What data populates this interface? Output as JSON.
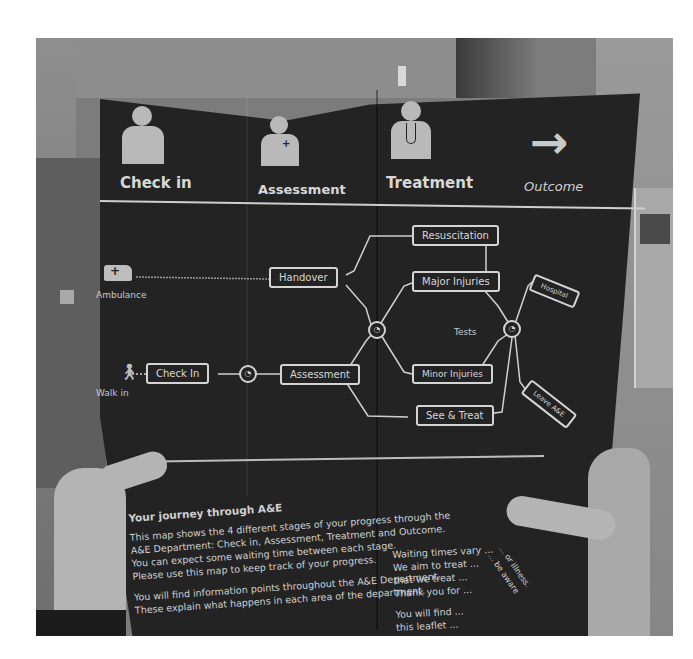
{
  "scene": {
    "description": "Photo of hands holding an A&E patient journey leaflet",
    "palette": {
      "leaflet": "#232323",
      "ink": "#d4d4d4",
      "wall": "#8d8d8d",
      "skin": "#b4b4b4",
      "frame": "#ffffff"
    }
  },
  "leaflet": {
    "stages": [
      {
        "label": "Check in",
        "icon": "person-icon"
      },
      {
        "label": "Assessment",
        "icon": "nurse-icon"
      },
      {
        "label": "Treatment",
        "icon": "doctor-stethoscope-icon"
      },
      {
        "label": "Outcome",
        "icon": "arrow-right-icon"
      }
    ],
    "entries": [
      {
        "label": "Ambulance",
        "icon": "ambulance-icon"
      },
      {
        "label": "Walk in",
        "icon": "walking-person-icon"
      }
    ],
    "nodes": {
      "handover": "Handover",
      "check_in": "Check In",
      "assessment": "Assessment",
      "resuscitation": "Resuscitation",
      "major_injuries": "Major Injuries",
      "minor_injuries": "Minor Injuries",
      "see_treat": "See & Treat",
      "tests": "Tests",
      "hospital": "Hospital",
      "leave_ae": "Leave A&E"
    },
    "clock_icon": "◔",
    "journey": {
      "title": "Your journey through A&E",
      "paragraph1": [
        "This map shows the 4 different stages of your progress through the",
        "A&E Department: Check in, Assessment, Treatment and Outcome.",
        "You can expect some waiting time between each stage.",
        "Please use this map to keep track of your progress."
      ],
      "paragraph2": [
        "You will find information points throughout the A&E Department.",
        "These explain what happens in each area of the department."
      ]
    },
    "waiting": {
      "paragraph1": [
        "Waiting times vary ...",
        "We aim to treat ...",
        "that we treat ...",
        "Thank you for ..."
      ],
      "paragraph2": [
        "You will find ...",
        "this leaflet ..."
      ],
      "folded_fragments": [
        "... or illness.",
        "... be aware"
      ]
    }
  }
}
